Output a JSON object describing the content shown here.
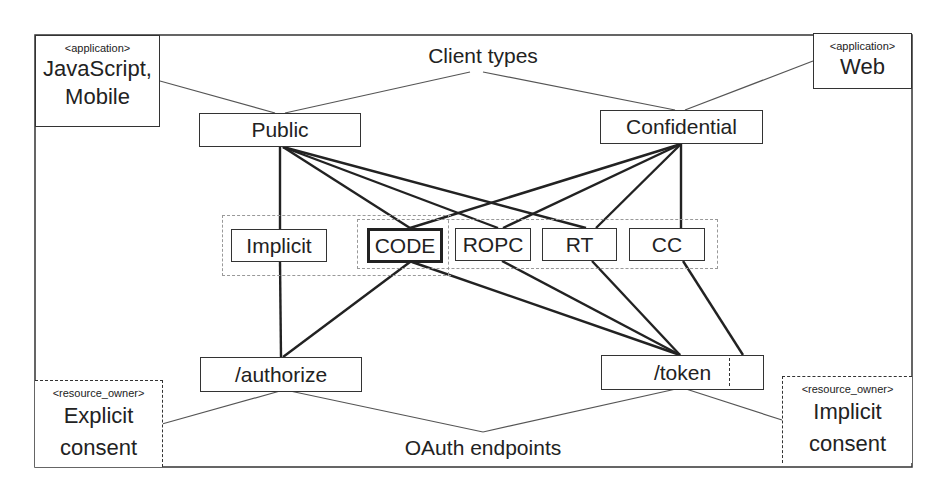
{
  "diagram": {
    "title_top": "Client types",
    "title_bottom": "OAuth endpoints",
    "applications": [
      {
        "stereotype": "<application>",
        "name_line1": "JavaScript,",
        "name_line2": "Mobile"
      },
      {
        "stereotype": "<application>",
        "name_line1": "Web",
        "name_line2": ""
      }
    ],
    "client_types": [
      {
        "label": "Public"
      },
      {
        "label": "Confidential"
      }
    ],
    "grant_types": [
      {
        "label": "Implicit",
        "emphasized": false
      },
      {
        "label": "CODE",
        "emphasized": true
      },
      {
        "label": "ROPC",
        "emphasized": false
      },
      {
        "label": "RT",
        "emphasized": false
      },
      {
        "label": "CC",
        "emphasized": false
      }
    ],
    "endpoints": [
      {
        "label": "/authorize"
      },
      {
        "label": "/token"
      }
    ],
    "resource_owners": [
      {
        "stereotype": "<resource_owner>",
        "name_line1": "Explicit",
        "name_line2": "consent"
      },
      {
        "stereotype": "<resource_owner>",
        "name_line1": "Implicit",
        "name_line2": "consent"
      }
    ],
    "edges": [
      {
        "from": "Public",
        "to": "Implicit"
      },
      {
        "from": "Public",
        "to": "CODE"
      },
      {
        "from": "Public",
        "to": "ROPC"
      },
      {
        "from": "Public",
        "to": "RT"
      },
      {
        "from": "Confidential",
        "to": "CODE"
      },
      {
        "from": "Confidential",
        "to": "ROPC"
      },
      {
        "from": "Confidential",
        "to": "RT"
      },
      {
        "from": "Confidential",
        "to": "CC"
      },
      {
        "from": "Implicit",
        "to": "/authorize"
      },
      {
        "from": "CODE",
        "to": "/authorize"
      },
      {
        "from": "CODE",
        "to": "/token"
      },
      {
        "from": "ROPC",
        "to": "/token"
      },
      {
        "from": "RT",
        "to": "/token"
      },
      {
        "from": "CC",
        "to": "/token"
      }
    ],
    "colors": {
      "line": "#222222",
      "thin_line": "#555555",
      "group_border": "#999999",
      "background": "#ffffff"
    }
  }
}
